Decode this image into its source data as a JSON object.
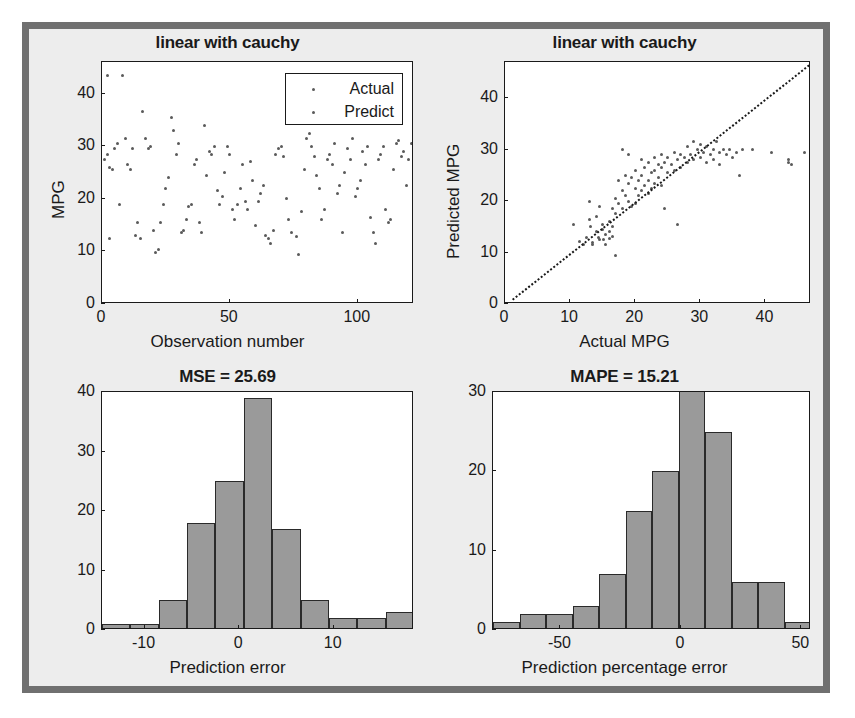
{
  "figure": {
    "background": "#ededed",
    "border_color": "#707070",
    "marker_color": "#5a5a5a",
    "bar_color": "#9a9a9a",
    "bar_edge_color": "#2a2a2a"
  },
  "chart_data": [
    {
      "id": "observation-scatter",
      "type": "scatter",
      "title": "linear with cauchy",
      "xlabel": "Observation number",
      "ylabel": "MPG",
      "xlim": [
        0,
        122
      ],
      "ylim": [
        0,
        46
      ],
      "xticks": [
        0,
        50,
        100
      ],
      "yticks": [
        0,
        10,
        20,
        30,
        40
      ],
      "grid": false,
      "legend": {
        "position": "top-right",
        "entries": [
          {
            "label": "Actual",
            "marker": "dot",
            "color": "#5a5a5a"
          },
          {
            "label": "Predict",
            "marker": "dot",
            "color": "#5a5a5a"
          }
        ]
      },
      "series": [
        {
          "name": "Actual",
          "points": [
            [
              1,
              27.5
            ],
            [
              2,
              28.5
            ],
            [
              2,
              43.5
            ],
            [
              3,
              26.0
            ],
            [
              3,
              12.5
            ],
            [
              4,
              25.5
            ],
            [
              5,
              29.5
            ],
            [
              6,
              30.5
            ],
            [
              7,
              19.0
            ],
            [
              8,
              43.5
            ],
            [
              9,
              31.5
            ],
            [
              10,
              26.5
            ],
            [
              11,
              25.5
            ],
            [
              12,
              29.5
            ],
            [
              13,
              13.0
            ],
            [
              14,
              15.5
            ],
            [
              15,
              12.5
            ],
            [
              16,
              36.5
            ],
            [
              17,
              31.5
            ],
            [
              18,
              29.5
            ],
            [
              19,
              30.0
            ],
            [
              20,
              14.0
            ],
            [
              21,
              9.8
            ],
            [
              22,
              10.3
            ],
            [
              23,
              15.5
            ],
            [
              24,
              19.0
            ],
            [
              25,
              22.0
            ],
            [
              26,
              24.0
            ],
            [
              27,
              35.5
            ],
            [
              28,
              33.0
            ],
            [
              29,
              28.5
            ],
            [
              30,
              30.5
            ],
            [
              31,
              13.5
            ],
            [
              32,
              14.0
            ],
            [
              33,
              16.0
            ],
            [
              34,
              18.5
            ],
            [
              35,
              19.0
            ],
            [
              36,
              26.5
            ],
            [
              37,
              27.5
            ],
            [
              38,
              15.5
            ],
            [
              39,
              13.5
            ],
            [
              40,
              34.0
            ],
            [
              41,
              24.5
            ],
            [
              42,
              29.0
            ],
            [
              43,
              28.5
            ],
            [
              44,
              30.0
            ],
            [
              45,
              21.5
            ],
            [
              46,
              19.0
            ],
            [
              47,
              20.5
            ],
            [
              48,
              25.0
            ],
            [
              49,
              30.0
            ],
            [
              50,
              28.5
            ],
            [
              51,
              18.0
            ],
            [
              52,
              16.0
            ],
            [
              53,
              19.0
            ],
            [
              54,
              22.0
            ],
            [
              55,
              26.5
            ],
            [
              56,
              19.5
            ],
            [
              57,
              18.0
            ],
            [
              58,
              27.0
            ],
            [
              59,
              23.5
            ],
            [
              60,
              15.0
            ],
            [
              61,
              19.5
            ],
            [
              62,
              21.0
            ],
            [
              63,
              22.5
            ],
            [
              64,
              13.0
            ],
            [
              65,
              12.5
            ],
            [
              66,
              11.5
            ],
            [
              67,
              14.0
            ],
            [
              68,
              28.5
            ],
            [
              69,
              29.5
            ],
            [
              70,
              30.0
            ],
            [
              71,
              28.0
            ],
            [
              72,
              20.0
            ],
            [
              73,
              16.0
            ],
            [
              74,
              13.5
            ],
            [
              75,
              36.5
            ],
            [
              76,
              12.8
            ],
            [
              77,
              9.5
            ],
            [
              78,
              17.5
            ],
            [
              79,
              25.5
            ],
            [
              80,
              31.5
            ],
            [
              81,
              32.5
            ],
            [
              82,
              30.0
            ],
            [
              83,
              28.0
            ],
            [
              84,
              24.5
            ],
            [
              85,
              22.0
            ],
            [
              86,
              16.0
            ],
            [
              87,
              18.0
            ],
            [
              88,
              27.5
            ],
            [
              89,
              28.5
            ],
            [
              90,
              26.5
            ],
            [
              91,
              30.5
            ],
            [
              92,
              21.0
            ],
            [
              93,
              22.5
            ],
            [
              94,
              13.5
            ],
            [
              95,
              25.0
            ],
            [
              96,
              29.5
            ],
            [
              97,
              27.5
            ],
            [
              98,
              31.5
            ],
            [
              99,
              20.5
            ],
            [
              100,
              22.0
            ],
            [
              101,
              23.5
            ],
            [
              102,
              29.0
            ],
            [
              103,
              26.5
            ],
            [
              104,
              30.0
            ],
            [
              105,
              16.5
            ],
            [
              106,
              13.5
            ],
            [
              107,
              11.5
            ],
            [
              108,
              27.5
            ],
            [
              109,
              28.5
            ],
            [
              110,
              30.0
            ],
            [
              111,
              18.0
            ],
            [
              112,
              15.5
            ],
            [
              113,
              16.0
            ],
            [
              114,
              25.5
            ],
            [
              115,
              30.5
            ],
            [
              116,
              31.0
            ],
            [
              117,
              28.0
            ],
            [
              118,
              29.0
            ],
            [
              119,
              22.5
            ],
            [
              120,
              27.5
            ],
            [
              121,
              30.5
            ],
            [
              122,
              26.0
            ]
          ]
        }
      ]
    },
    {
      "id": "actual-vs-predicted-scatter",
      "type": "scatter",
      "title": "linear with cauchy",
      "xlabel": "Actual MPG",
      "ylabel": "Predicted MPG",
      "xlim": [
        0,
        47
      ],
      "ylim": [
        0,
        47
      ],
      "xticks": [
        0,
        10,
        20,
        30,
        40
      ],
      "yticks": [
        0,
        10,
        20,
        30,
        40
      ],
      "grid": false,
      "reference_line": {
        "type": "identity",
        "style": "dotted",
        "from": [
          1,
          1
        ],
        "to": [
          47,
          47
        ]
      },
      "series": [
        {
          "name": "Predicted vs Actual",
          "points": [
            [
              10.5,
              15.5
            ],
            [
              11.5,
              12.2
            ],
            [
              12.0,
              11.5
            ],
            [
              12.5,
              13.0
            ],
            [
              13.0,
              20.0
            ],
            [
              13.0,
              16.5
            ],
            [
              13.2,
              15.0
            ],
            [
              13.5,
              12.0
            ],
            [
              13.5,
              11.5
            ],
            [
              14.0,
              17.0
            ],
            [
              14.0,
              14.0
            ],
            [
              14.3,
              13.0
            ],
            [
              14.5,
              19.0
            ],
            [
              14.5,
              12.5
            ],
            [
              15.0,
              15.5
            ],
            [
              15.0,
              14.5
            ],
            [
              15.2,
              12.5
            ],
            [
              15.5,
              13.5
            ],
            [
              15.5,
              11.5
            ],
            [
              16.0,
              16.0
            ],
            [
              16.0,
              14.0
            ],
            [
              16.0,
              12.8
            ],
            [
              16.5,
              18.5
            ],
            [
              16.5,
              15.0
            ],
            [
              16.5,
              13.2
            ],
            [
              17.0,
              20.5
            ],
            [
              17.0,
              17.5
            ],
            [
              17.0,
              9.5
            ],
            [
              17.5,
              24.0
            ],
            [
              17.5,
              19.5
            ],
            [
              18.0,
              30.0
            ],
            [
              18.0,
              22.0
            ],
            [
              18.0,
              18.5
            ],
            [
              18.5,
              25.0
            ],
            [
              18.5,
              21.0
            ],
            [
              19.0,
              29.0
            ],
            [
              19.0,
              23.5
            ],
            [
              19.0,
              20.0
            ],
            [
              19.5,
              24.5
            ],
            [
              19.5,
              19.0
            ],
            [
              20.0,
              26.0
            ],
            [
              20.0,
              22.5
            ],
            [
              20.0,
              19.5
            ],
            [
              20.5,
              24.0
            ],
            [
              20.5,
              21.0
            ],
            [
              21.0,
              28.0
            ],
            [
              21.0,
              25.0
            ],
            [
              21.0,
              22.0
            ],
            [
              21.5,
              26.5
            ],
            [
              21.5,
              23.0
            ],
            [
              22.0,
              27.5
            ],
            [
              22.0,
              24.0
            ],
            [
              22.0,
              21.5
            ],
            [
              22.5,
              25.5
            ],
            [
              22.5,
              22.5
            ],
            [
              23.0,
              28.5
            ],
            [
              23.0,
              26.0
            ],
            [
              23.0,
              23.5
            ],
            [
              23.5,
              27.0
            ],
            [
              23.5,
              24.5
            ],
            [
              24.0,
              29.0
            ],
            [
              24.0,
              26.5
            ],
            [
              24.0,
              23.0
            ],
            [
              24.5,
              27.5
            ],
            [
              24.5,
              18.5
            ],
            [
              25.0,
              28.5
            ],
            [
              25.0,
              25.5
            ],
            [
              25.5,
              27.0
            ],
            [
              26.0,
              29.5
            ],
            [
              26.0,
              26.0
            ],
            [
              26.5,
              28.0
            ],
            [
              26.5,
              15.5
            ],
            [
              27.0,
              29.0
            ],
            [
              27.0,
              26.5
            ],
            [
              27.5,
              28.5
            ],
            [
              28.0,
              30.5
            ],
            [
              28.0,
              27.5
            ],
            [
              28.5,
              29.0
            ],
            [
              29.0,
              31.5
            ],
            [
              29.0,
              28.0
            ],
            [
              29.5,
              30.0
            ],
            [
              30.0,
              31.0
            ],
            [
              30.0,
              28.5
            ],
            [
              30.5,
              29.5
            ],
            [
              31.0,
              30.5
            ],
            [
              31.0,
              27.5
            ],
            [
              31.5,
              29.0
            ],
            [
              32.0,
              30.0
            ],
            [
              32.0,
              28.0
            ],
            [
              32.5,
              31.5
            ],
            [
              33.0,
              29.5
            ],
            [
              33.0,
              27.0
            ],
            [
              33.5,
              30.0
            ],
            [
              34.0,
              29.0
            ],
            [
              34.5,
              30.0
            ],
            [
              35.0,
              28.5
            ],
            [
              35.5,
              29.5
            ],
            [
              36.0,
              25.0
            ],
            [
              36.5,
              30.0
            ],
            [
              38.0,
              30.0
            ],
            [
              41.0,
              29.5
            ],
            [
              43.5,
              28.0
            ],
            [
              43.5,
              27.5
            ],
            [
              44.0,
              27.0
            ],
            [
              46.0,
              29.5
            ]
          ]
        }
      ]
    },
    {
      "id": "prediction-error-histogram",
      "type": "bar",
      "title": "MSE = 25.69",
      "xlabel": "Prediction error",
      "ylabel": "",
      "xlim": [
        -14.5,
        18.5
      ],
      "ylim": [
        0,
        40
      ],
      "xticks": [
        -10,
        0,
        10
      ],
      "yticks": [
        0,
        10,
        20,
        30,
        40
      ],
      "grid": false,
      "bin_edges": [
        -14.5,
        -11.5,
        -8.5,
        -5.5,
        -2.5,
        0.5,
        3.5,
        6.5,
        9.5,
        12.5,
        15.5,
        18.5
      ],
      "bin_centers": [
        -13,
        -10,
        -7,
        -4,
        -1,
        2,
        5,
        8,
        11,
        14,
        17
      ],
      "values": [
        1,
        1,
        5,
        18,
        25,
        39,
        17,
        5,
        2,
        2,
        3
      ]
    },
    {
      "id": "prediction-percentage-error-histogram",
      "type": "bar",
      "title": "MAPE = 15.21",
      "xlabel": "Prediction percentage error",
      "ylabel": "",
      "xlim": [
        -78,
        54
      ],
      "ylim": [
        0,
        30
      ],
      "xticks": [
        -50,
        0,
        50
      ],
      "yticks": [
        0,
        10,
        20,
        30
      ],
      "grid": false,
      "bin_edges": [
        -78,
        -67,
        -56,
        -45,
        -34,
        -23,
        -12,
        -1,
        10,
        21,
        32,
        43,
        54
      ],
      "bin_centers": [
        -72.5,
        -61.5,
        -50.5,
        -39.5,
        -28.5,
        -17.5,
        -6.5,
        4.5,
        15.5,
        26.5,
        37.5,
        48.5
      ],
      "values": [
        1,
        2,
        2,
        3,
        7,
        15,
        20,
        33,
        25,
        6,
        6,
        1
      ],
      "clipped_note": "tallest bar exceeds y-axis maximum"
    }
  ]
}
